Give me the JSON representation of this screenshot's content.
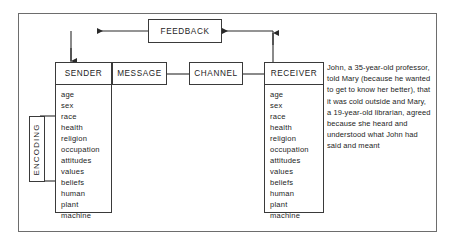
{
  "diagram": {
    "feedback": {
      "label": "FEEDBACK"
    },
    "chain": [
      {
        "id": "sender",
        "label": "SENDER"
      },
      {
        "id": "message",
        "label": "MESSAGE"
      },
      {
        "id": "channel",
        "label": "CHANNEL"
      },
      {
        "id": "receiver",
        "label": "RECEIVER"
      }
    ],
    "sender_attributes": [
      "age",
      "sex",
      "race",
      "health",
      "religion",
      "occupation",
      "attitudes",
      "values",
      "beliefs",
      "human",
      "plant",
      "machine"
    ],
    "receiver_attributes": [
      "age",
      "sex",
      "race",
      "health",
      "religion",
      "occupation",
      "attitudes",
      "values",
      "beliefs",
      "human",
      "plant",
      "machine"
    ],
    "encoding_label": "ENCODING",
    "decoding_label": "DECODING",
    "story": "John, a 35-year-old professor, told Mary (because he wanted to get to know her better), that it was cold outside and Mary, a 19-year-old librarian, agreed because she heard and understood what John had said and meant",
    "colors": {
      "background": "#ffffff",
      "frame_border": "#6d6d6d",
      "box_border": "#3a3a3a",
      "text": "#1d1d1d",
      "wire": "#2a2a2a"
    }
  }
}
